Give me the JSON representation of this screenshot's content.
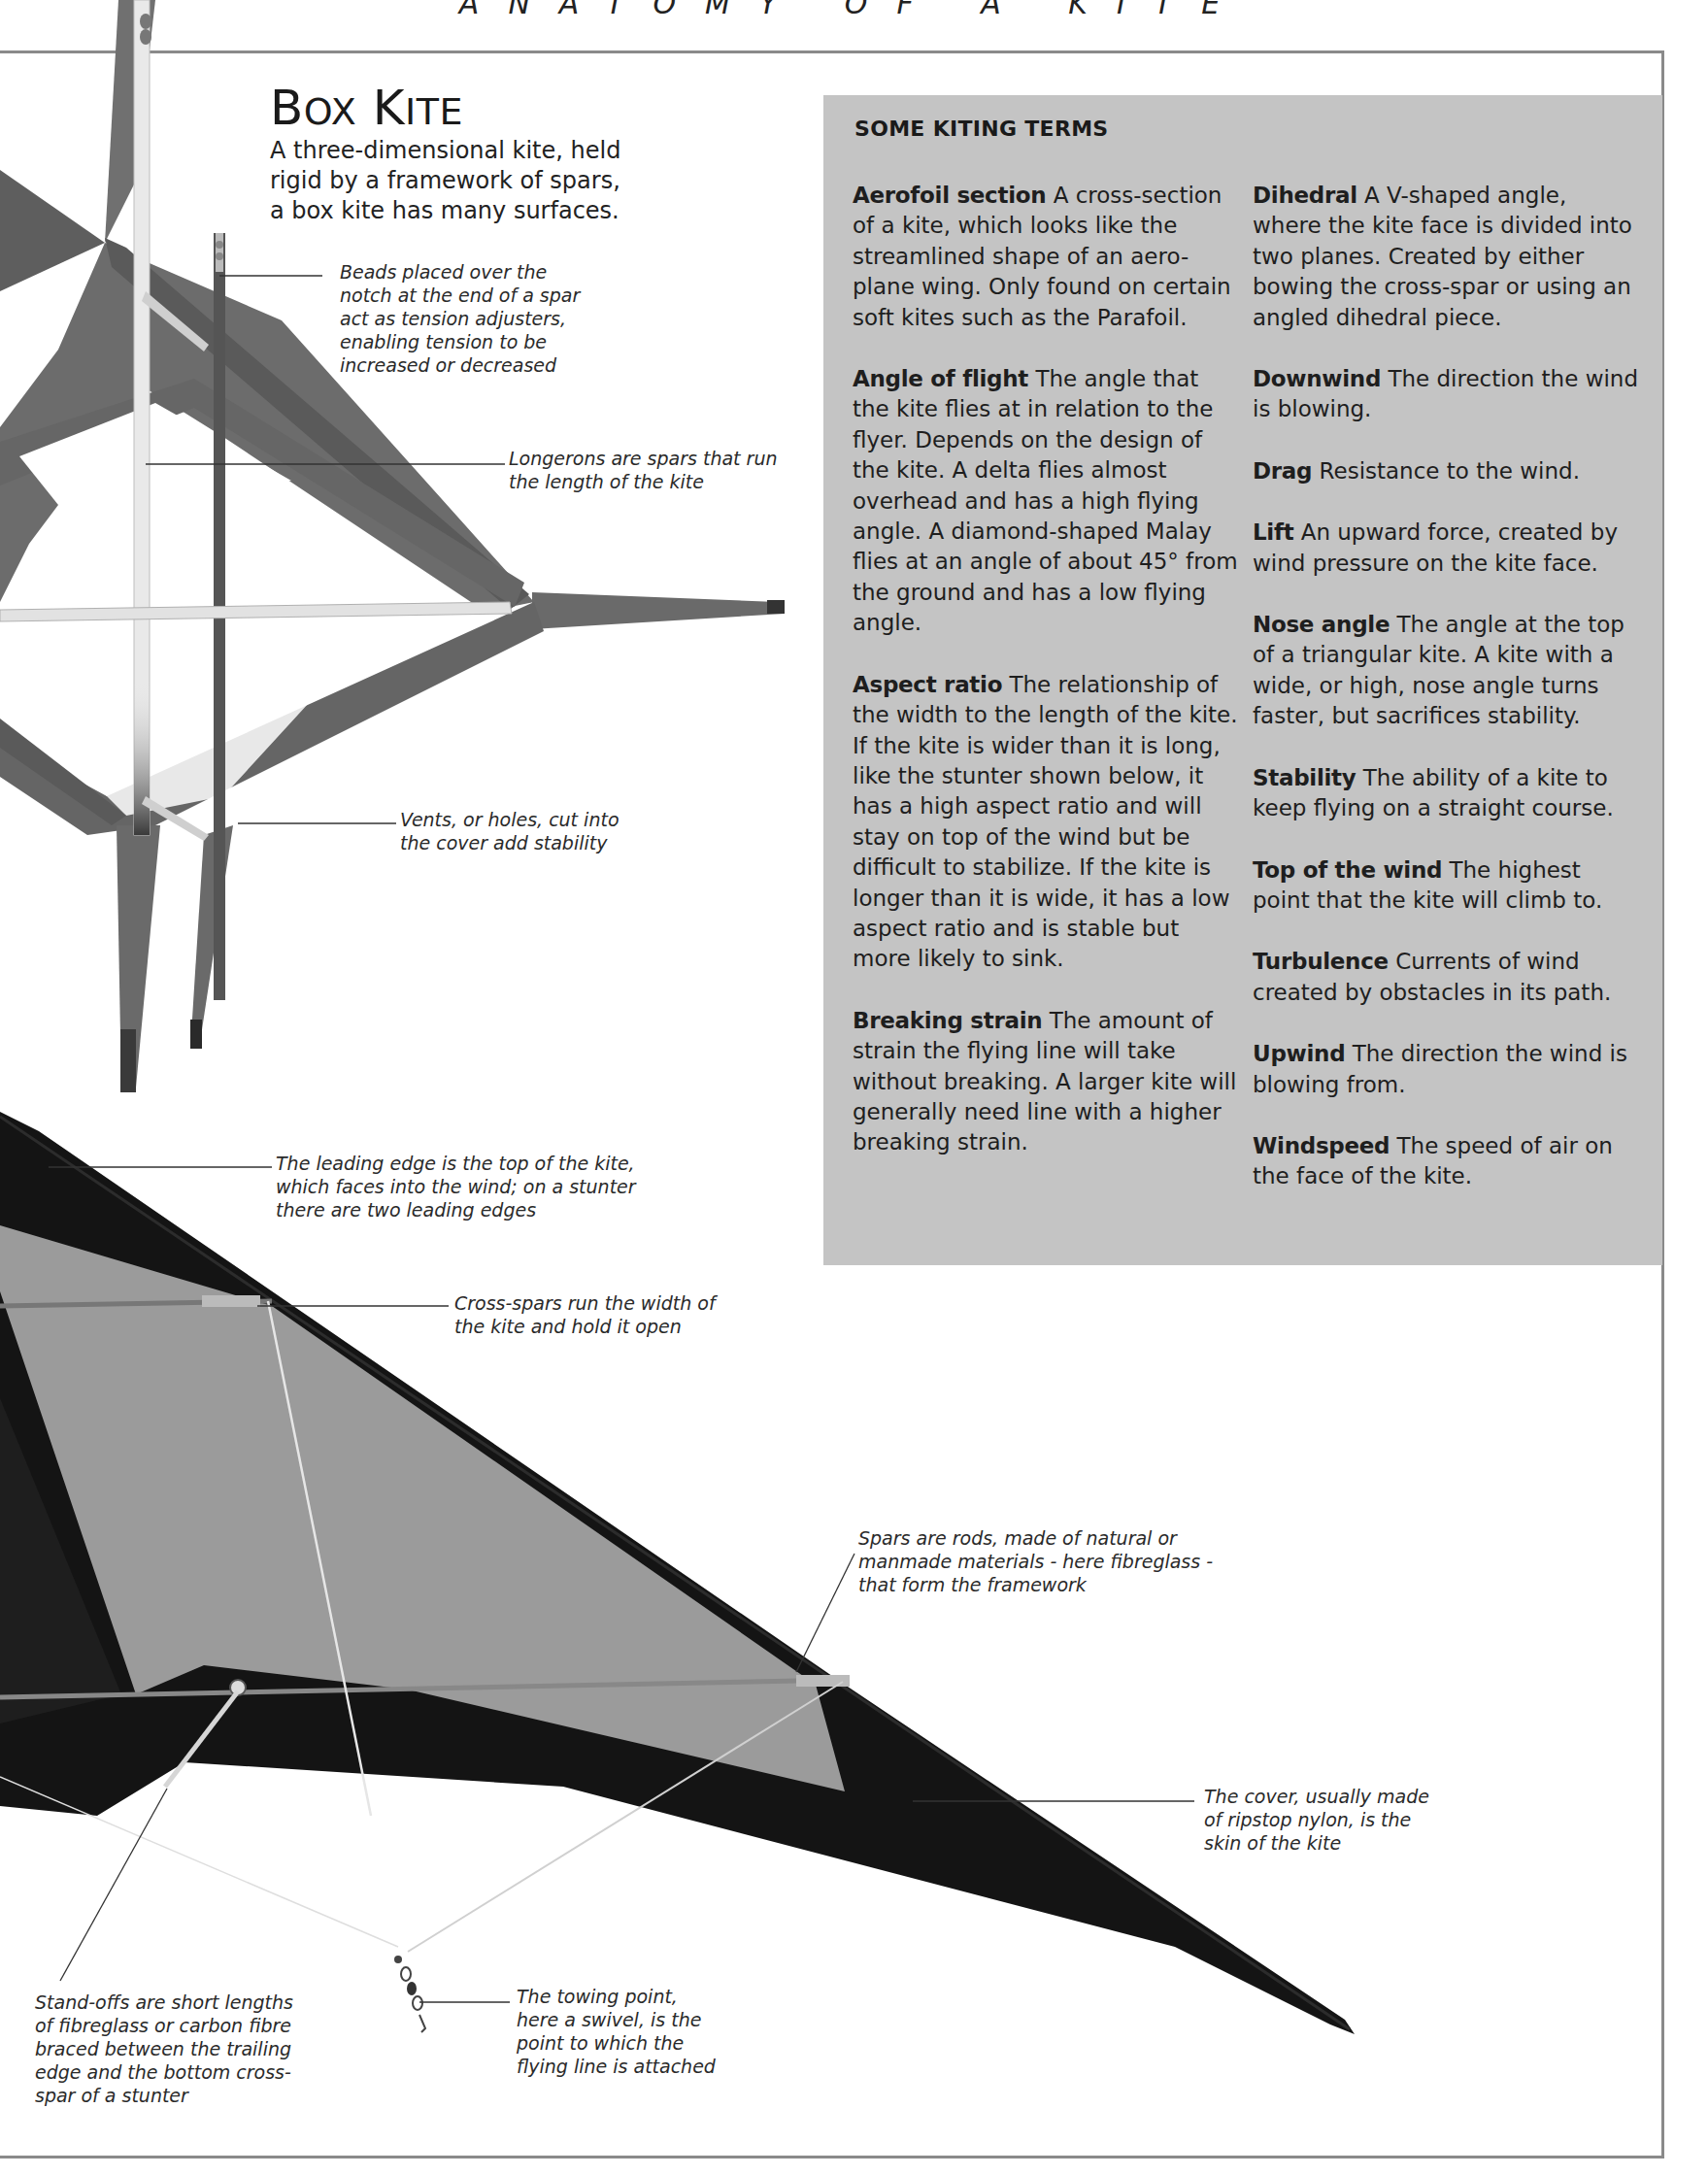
{
  "page": {
    "running_head": "ANATOMY OF A KITE"
  },
  "box_kite": {
    "title_first": "B",
    "title_first_sc": "OX",
    "title_second": "K",
    "title_second_sc": "ITE",
    "description": "A three-dimensional kite, held rigid by a framework of spars, a box kite has many surfaces.",
    "callouts": {
      "beads": "Beads placed over the notch at the end of a spar act as tension adjusters, enabling tension to be increased or decreased",
      "longerons": "Longerons are spars that run the length of the kite",
      "vents": "Vents, or holes, cut into the cover add stability"
    }
  },
  "stunter_kite": {
    "callouts": {
      "leading_edge": "The leading edge is the top of the kite, which faces into the wind; on a stunter there are two leading edges",
      "cross_spars": "Cross-spars run the width of the kite and hold it open",
      "spars": "Spars are rods, made of natural or manmade materials - here fibreglass - that form the framework",
      "cover": "The cover, usually made of ripstop nylon, is the skin of the kite",
      "stand_offs": "Stand-offs are short lengths of fibreglass or carbon fibre braced between the trailing edge and the bottom cross-spar of a stunter",
      "towing_point": "The towing point, here a swivel, is the point to which the flying line is attached"
    }
  },
  "kiting_terms": {
    "heading": "SOME KITING TERMS",
    "left_column": [
      {
        "term": "Aerofoil section",
        "definition": "A cross-section of a kite, which looks like the streamlined shape of an aero-plane wing. Only found on certain soft kites such as the Parafoil."
      },
      {
        "term": "Angle of flight",
        "definition": "The angle that the kite flies at in relation to the flyer. Depends on the design of the kite. A delta flies almost overhead and has a high flying angle. A diamond-shaped Malay flies at an angle of about 45° from the ground and has a low flying angle."
      },
      {
        "term": "Aspect ratio",
        "definition": "The relationship of the width to the length of the kite. If the kite is wider than it is long, like the stunter shown below, it has a high aspect ratio and will stay on top of the wind but be difficult to stabilize. If the kite is longer than it is wide, it has a low aspect ratio and is stable but more likely to sink."
      },
      {
        "term": "Breaking strain",
        "definition": "The amount of strain the flying line will take without breaking. A larger kite will generally need line with a higher breaking strain."
      }
    ],
    "right_column": [
      {
        "term": "Dihedral",
        "definition": "A V-shaped angle, where the kite face is divided into two planes. Created by either bowing the cross-spar or using an angled dihedral piece."
      },
      {
        "term": "Downwind",
        "definition": "The direction the wind is blowing."
      },
      {
        "term": "Drag",
        "definition": "Resistance to the wind."
      },
      {
        "term": "Lift",
        "definition": "An upward force, created by wind pressure on the kite face."
      },
      {
        "term": "Nose angle",
        "definition": "The angle at the top of a triangular kite. A kite with a wide, or high, nose angle turns faster, but sacrifices stability."
      },
      {
        "term": "Stability",
        "definition": "The ability of a kite to keep flying on a straight course."
      },
      {
        "term": "Top of the wind",
        "definition": "The highest point that the kite will climb to."
      },
      {
        "term": "Turbulence",
        "definition": "Currents of wind created by obstacles in its path."
      },
      {
        "term": "Upwind",
        "definition": "The direction the wind is blowing from."
      },
      {
        "term": "Windspeed",
        "definition": "The speed of air on the face of the kite."
      }
    ]
  },
  "colors": {
    "terms_box_bg": "#c4c4c4",
    "box_kite_fabric": "#6e6e6e",
    "stunter_dark": "#141414",
    "stunter_panel": "#9a9a9a",
    "frame_rule": "#8a8a8a"
  }
}
